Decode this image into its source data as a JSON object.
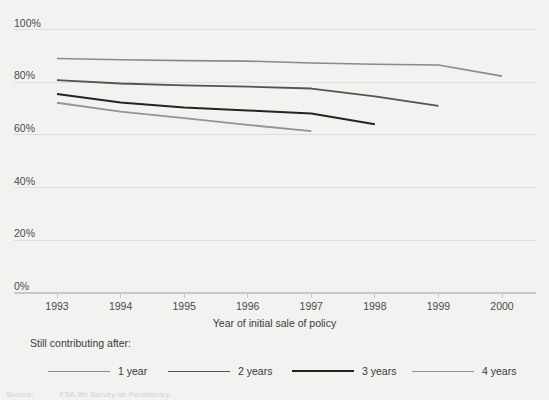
{
  "chart_data": {
    "type": "line",
    "title": "",
    "xlabel": "Year of initial sale of policy",
    "ylabel": "",
    "x": [
      1993,
      1994,
      1995,
      1996,
      1997,
      1998,
      1999,
      2000
    ],
    "xtick_labels": [
      "1993",
      "1994",
      "1995",
      "1996",
      "1997",
      "1998",
      "1999",
      "2000"
    ],
    "ytick_labels": [
      "0%",
      "20%",
      "40%",
      "60%",
      "80%",
      "100%"
    ],
    "ytick_values": [
      0,
      20,
      40,
      60,
      80,
      100
    ],
    "ylim": [
      0,
      100
    ],
    "xlim": [
      1993,
      2000
    ],
    "grid": "horizontal",
    "legend_position": "bottom",
    "legend_title": "Still contributing after:",
    "series": [
      {
        "name": "1 year",
        "color": "#8a8a88",
        "width": 1.6,
        "x": [
          1993,
          1994,
          1995,
          1996,
          1997,
          1998,
          1999,
          2000
        ],
        "values": [
          89.0,
          88.5,
          88.2,
          88.0,
          87.3,
          86.8,
          86.5,
          82.3
        ]
      },
      {
        "name": "2 years",
        "color": "#53534f",
        "width": 1.8,
        "x": [
          1993,
          1994,
          1995,
          1996,
          1997,
          1998,
          1999
        ],
        "values": [
          80.8,
          79.5,
          78.8,
          78.3,
          77.6,
          74.6,
          71.0
        ]
      },
      {
        "name": "3 years",
        "color": "#24241f",
        "width": 2.0,
        "x": [
          1993,
          1994,
          1995,
          1996,
          1997,
          1998
        ],
        "values": [
          75.5,
          72.3,
          70.4,
          69.3,
          68.1,
          64.0
        ]
      },
      {
        "name": "4 years",
        "color": "#949490",
        "width": 1.8,
        "x": [
          1993,
          1994,
          1995,
          1996,
          1997
        ],
        "values": [
          72.2,
          68.8,
          66.4,
          63.8,
          61.4
        ]
      }
    ]
  },
  "legend": {
    "title": "Still contributing after:",
    "items": [
      {
        "label": "1 year"
      },
      {
        "label": "2 years"
      },
      {
        "label": "3 years"
      },
      {
        "label": "4 years"
      }
    ]
  },
  "source": {
    "label": "Source:",
    "text": "FSA 9th Survey on Persistency"
  },
  "colors": {
    "background": "#f2f2f0",
    "grid": "#dedede",
    "axis": "#c8c8c6",
    "text": "#3a3a38"
  }
}
